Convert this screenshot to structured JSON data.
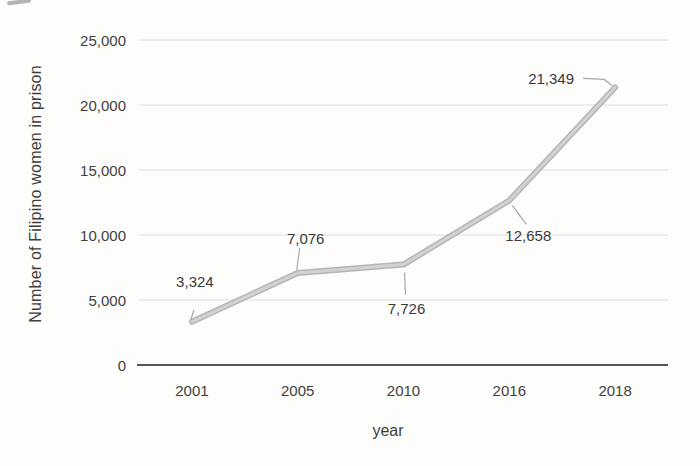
{
  "chart_data": {
    "type": "line",
    "title": "",
    "xlabel": "year",
    "ylabel": "Number of Filipino women in prison",
    "categories": [
      "2001",
      "2005",
      "2010",
      "2016",
      "2018"
    ],
    "values": [
      3324,
      7076,
      7726,
      12658,
      21349
    ],
    "data_labels": [
      "3,324",
      "7,076",
      "7,726",
      "12,658",
      "21,349"
    ],
    "series": [
      {
        "name": "Number of Filipino women in prison",
        "values": [
          3324,
          7076,
          7726,
          12658,
          21349
        ]
      }
    ],
    "ylim": [
      0,
      25000
    ],
    "y_ticks": [
      {
        "value": 0,
        "label": "0"
      },
      {
        "value": 5000,
        "label": "5,000"
      },
      {
        "value": 10000,
        "label": "10,000"
      },
      {
        "value": 15000,
        "label": "15,000"
      },
      {
        "value": 20000,
        "label": "20,000"
      },
      {
        "value": 25000,
        "label": "25,000"
      }
    ],
    "grid": "horizontal",
    "legend_position": "none",
    "colors": {
      "line_edge": "#adadad",
      "line_core": "#d2d2d2",
      "leader": "#a8a8a8",
      "gridline": "#dcdcdc",
      "axis": "#555555",
      "text": "#3d3d3d",
      "background": "#fdfdfc"
    }
  }
}
